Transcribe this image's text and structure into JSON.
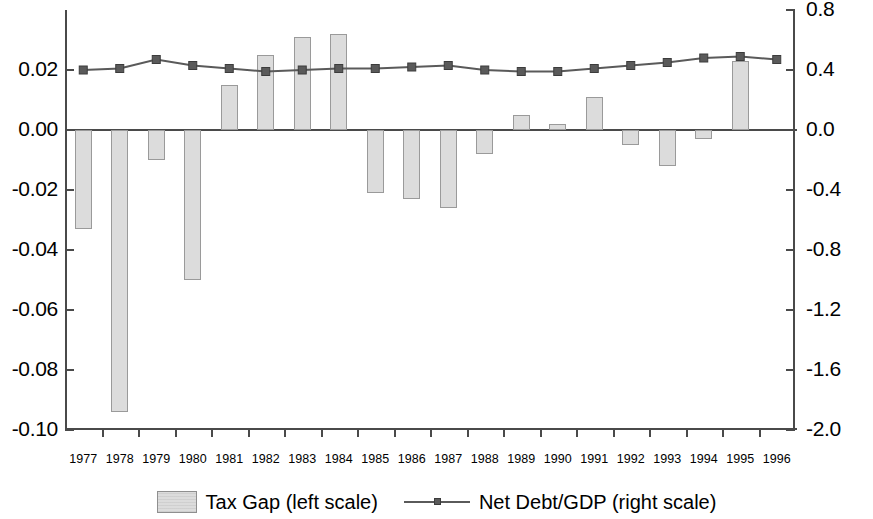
{
  "chart_data": {
    "type": "bar",
    "title": "",
    "xlabel": "",
    "ylabel": "",
    "grid": false,
    "legend_position": "bottom-center",
    "categories": [
      "1977",
      "1978",
      "1979",
      "1980",
      "1981",
      "1982",
      "1983",
      "1984",
      "1985",
      "1986",
      "1987",
      "1988",
      "1989",
      "1990",
      "1991",
      "1992",
      "1993",
      "1994",
      "1995",
      "1996"
    ],
    "left_axis": {
      "label": "Tax Gap (left scale)",
      "ylim": [
        -0.1,
        0.04
      ],
      "ticks": [
        0.02,
        0.0,
        -0.02,
        -0.04,
        -0.06,
        -0.08,
        -0.1
      ],
      "tick_labels": [
        "0.02",
        "0.00",
        "-0.02",
        "-0.04",
        "-0.06",
        "-0.08",
        "-0.10"
      ]
    },
    "right_axis": {
      "label": "Net Debt/GDP (right scale)",
      "ylim": [
        -2.0,
        0.8
      ],
      "ticks": [
        0.8,
        0.4,
        0.0,
        -0.4,
        -0.8,
        -1.2,
        -1.6,
        -2.0
      ],
      "tick_labels": [
        "0.8",
        "0.4",
        "0.0",
        "-0.4",
        "-0.8",
        "-1.2",
        "-1.6",
        "-2.0"
      ]
    },
    "series": [
      {
        "name": "Tax Gap (left scale)",
        "type": "bar",
        "axis": "left",
        "color": "#dcdcdc",
        "values": [
          -0.033,
          -0.094,
          -0.01,
          -0.05,
          0.015,
          0.025,
          0.031,
          0.032,
          -0.021,
          -0.023,
          -0.026,
          -0.008,
          0.005,
          0.002,
          0.011,
          -0.005,
          -0.012,
          -0.003,
          0.023,
          0.0
        ]
      },
      {
        "name": "Net Debt/GDP (right scale)",
        "type": "line",
        "axis": "right",
        "color": "#5a5a5a",
        "values": [
          0.4,
          0.41,
          0.47,
          0.43,
          0.41,
          0.39,
          0.4,
          0.41,
          0.41,
          0.42,
          0.43,
          0.4,
          0.39,
          0.39,
          0.41,
          0.43,
          0.45,
          0.48,
          0.49,
          0.47
        ]
      }
    ]
  },
  "legend": {
    "bar_label": "Tax Gap (left scale)",
    "line_label": "Net Debt/GDP (right scale)"
  }
}
